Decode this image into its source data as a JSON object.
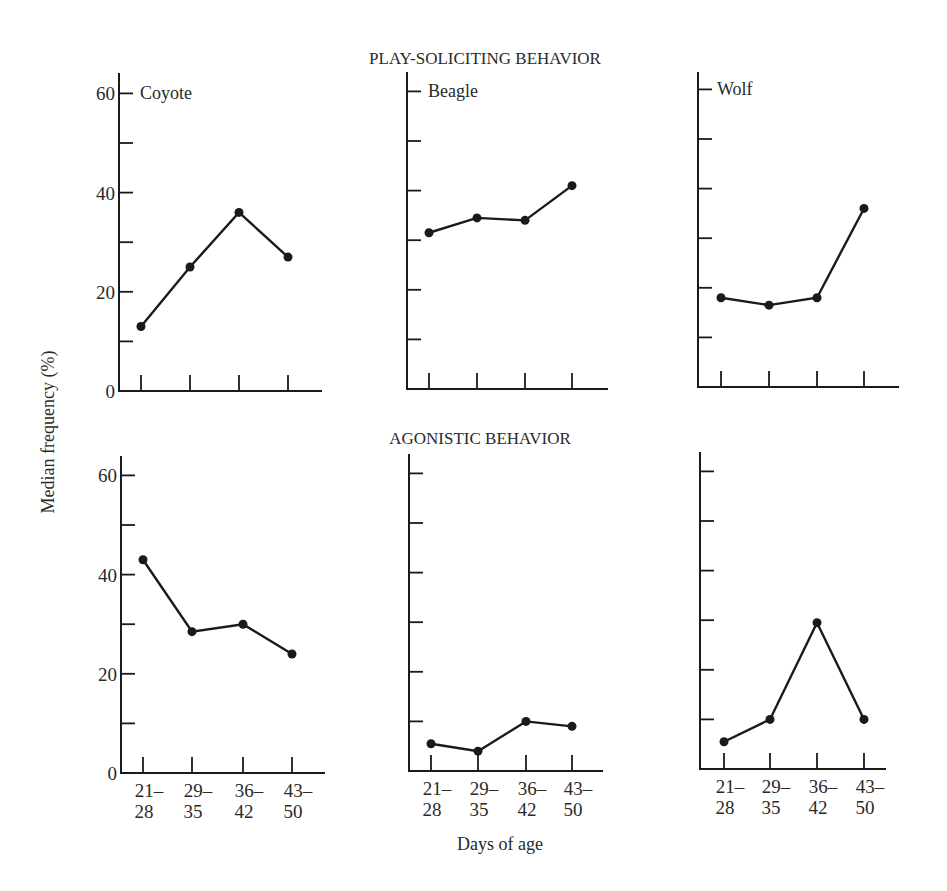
{
  "figure": {
    "ylabel": "Median frequency (%)",
    "xlabel": "Days of age",
    "rows": [
      {
        "title": "PLAY-SOLICITING BEHAVIOR"
      },
      {
        "title": "AGONISTIC BEHAVIOR"
      }
    ],
    "species": [
      "Coyote",
      "Beagle",
      "Wolf"
    ],
    "ytick_labels": [
      "0",
      "20",
      "40",
      "60"
    ],
    "xtick_labels_top": [
      "21–",
      "29–",
      "36–",
      "43–"
    ],
    "xtick_labels_bottom": [
      "28",
      "35",
      "42",
      "50"
    ]
  },
  "chart_data": [
    {
      "type": "line",
      "title": "PLAY-SOLICITING BEHAVIOR — Coyote",
      "categories": [
        "21–28",
        "29–35",
        "36–42",
        "43–50"
      ],
      "series": [
        {
          "name": "Coyote",
          "values": [
            13,
            25,
            36,
            27
          ]
        }
      ],
      "xlabel": "Days of age",
      "ylabel": "Median frequency (%)",
      "ylim": [
        0,
        60
      ],
      "yticks": [
        0,
        10,
        20,
        30,
        40,
        50,
        60
      ]
    },
    {
      "type": "line",
      "title": "PLAY-SOLICITING BEHAVIOR — Beagle",
      "categories": [
        "21–28",
        "29–35",
        "36–42",
        "43–50"
      ],
      "series": [
        {
          "name": "Beagle",
          "values": [
            31.5,
            34.5,
            34,
            41
          ]
        }
      ],
      "xlabel": "Days of age",
      "ylabel": "Median frequency (%)",
      "ylim": [
        0,
        60
      ],
      "yticks": [
        0,
        10,
        20,
        30,
        40,
        50,
        60
      ]
    },
    {
      "type": "line",
      "title": "PLAY-SOLICITING BEHAVIOR — Wolf",
      "categories": [
        "21–28",
        "29–35",
        "36–42",
        "43–50"
      ],
      "series": [
        {
          "name": "Wolf",
          "values": [
            18,
            16.5,
            18,
            36
          ]
        }
      ],
      "xlabel": "Days of age",
      "ylabel": "Median frequency (%)",
      "ylim": [
        0,
        60
      ],
      "yticks": [
        0,
        10,
        20,
        30,
        40,
        50,
        60
      ]
    },
    {
      "type": "line",
      "title": "AGONISTIC BEHAVIOR — Coyote",
      "categories": [
        "21–28",
        "29–35",
        "36–42",
        "43–50"
      ],
      "series": [
        {
          "name": "Coyote",
          "values": [
            43,
            28.5,
            30,
            24
          ]
        }
      ],
      "xlabel": "Days of age",
      "ylabel": "Median frequency (%)",
      "ylim": [
        0,
        60
      ],
      "yticks": [
        0,
        10,
        20,
        30,
        40,
        50,
        60
      ]
    },
    {
      "type": "line",
      "title": "AGONISTIC BEHAVIOR — Beagle",
      "categories": [
        "21–28",
        "29–35",
        "36–42",
        "43–50"
      ],
      "series": [
        {
          "name": "Beagle",
          "values": [
            5.5,
            4,
            10,
            9
          ]
        }
      ],
      "xlabel": "Days of age",
      "ylabel": "Median frequency (%)",
      "ylim": [
        0,
        60
      ],
      "yticks": [
        0,
        10,
        20,
        30,
        40,
        50,
        60
      ]
    },
    {
      "type": "line",
      "title": "AGONISTIC BEHAVIOR — Wolf",
      "categories": [
        "21–28",
        "29–35",
        "36–42",
        "43–50"
      ],
      "series": [
        {
          "name": "Wolf",
          "values": [
            5.5,
            10,
            29.5,
            10
          ]
        }
      ],
      "xlabel": "Days of age",
      "ylabel": "Median frequency (%)",
      "ylim": [
        0,
        60
      ],
      "yticks": [
        0,
        10,
        20,
        30,
        40,
        50,
        60
      ]
    }
  ],
  "style": {
    "line_color": "#1a1a1a",
    "background": "#ffffff"
  }
}
